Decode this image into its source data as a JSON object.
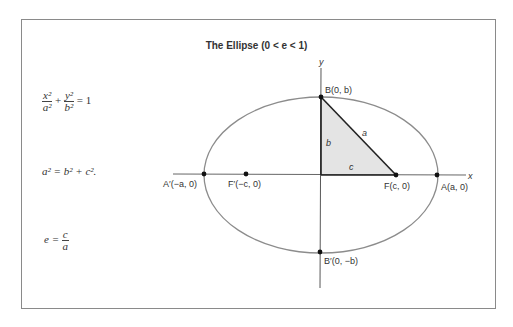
{
  "title": "The Ellipse (0 < e < 1)",
  "formulas": {
    "standard": {
      "x_num": "x²",
      "x_den": "a²",
      "plus": "+",
      "y_num": "y²",
      "y_den": "b²",
      "equals": "= 1"
    },
    "relation": "a² = b² + c².",
    "eccentricity": {
      "lhs": "e =",
      "num": "c",
      "den": "a"
    }
  },
  "labels": {
    "y_axis": "y",
    "x_axis": "x",
    "B": "B(0, b)",
    "B_prime": "B′(0, −b)",
    "A": "A(a, 0)",
    "A_prime": "A′(−a, 0)",
    "F": "F(c, 0)",
    "F_prime": "F′(−c, 0)",
    "side_a": "a",
    "side_b": "b",
    "side_c": "c"
  },
  "colors": {
    "ellipse": "#8c8c8c",
    "triangle_fill": "#e4e4e4",
    "lines": "#222222"
  }
}
